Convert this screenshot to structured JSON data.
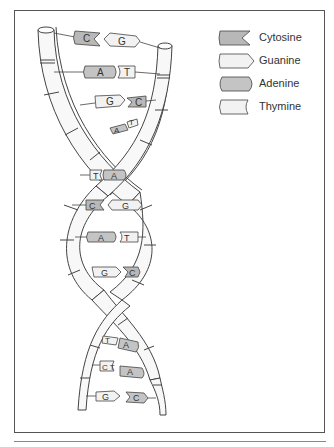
{
  "diagram": {
    "colors": {
      "cytosine": "#b8b8b8",
      "guanine": "#f2f2f2",
      "adenine": "#c4c4c4",
      "thymine": "#f2f2f2",
      "strand": "#f7f7f7",
      "outline": "#444444",
      "frame": "#555555"
    },
    "legend": [
      {
        "key": "cytosine",
        "label": "Cytosine",
        "shape": "notched-right",
        "shade": "dark"
      },
      {
        "key": "guanine",
        "label": "Guanine",
        "shape": "pointed-right",
        "shade": "light"
      },
      {
        "key": "adenine",
        "label": "Adenine",
        "shape": "rounded",
        "shade": "dark"
      },
      {
        "key": "thymine",
        "label": "Thymine",
        "shape": "notched-right",
        "shade": "light"
      }
    ],
    "base_pairs": [
      {
        "left": "C",
        "right": "G"
      },
      {
        "left": "A",
        "right": "T"
      },
      {
        "left": "G",
        "right": "C"
      },
      {
        "left": "A",
        "right": "T"
      },
      {
        "left": "T",
        "right": "A"
      },
      {
        "left": "C",
        "right": "G"
      },
      {
        "left": "A",
        "right": "T"
      },
      {
        "left": "G",
        "right": "C"
      },
      {
        "left": "T",
        "right": "A"
      },
      {
        "left": "C",
        "right": "A"
      },
      {
        "left": "G",
        "right": "C"
      }
    ]
  }
}
